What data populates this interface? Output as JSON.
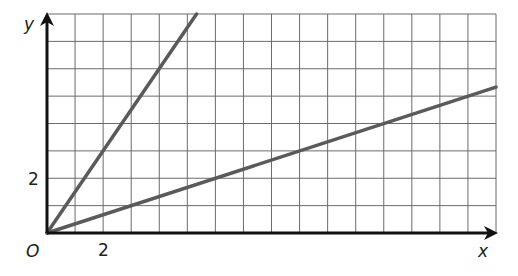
{
  "chart_data": {
    "type": "line",
    "title": "",
    "xlabel": "x",
    "ylabel": "y",
    "origin_label": "O",
    "xlim": [
      0,
      16
    ],
    "ylim": [
      0,
      8
    ],
    "grid": true,
    "grid_step": 1,
    "x_ticks": [
      {
        "value": 2,
        "label": "2"
      }
    ],
    "y_ticks": [
      {
        "value": 2,
        "label": "2"
      }
    ],
    "series": [
      {
        "name": "steep line",
        "equation": "y = 1.5x",
        "points": [
          [
            0,
            0
          ],
          [
            2,
            3
          ],
          [
            5.33,
            8
          ]
        ],
        "color": "#5a5a5a"
      },
      {
        "name": "shallow line",
        "equation": "y = x/3",
        "points": [
          [
            0,
            0
          ],
          [
            3,
            1
          ],
          [
            9,
            3
          ],
          [
            16,
            5.33
          ]
        ],
        "color": "#5a5a5a"
      }
    ]
  },
  "colors": {
    "grid": "#6b6b6b",
    "axis": "#111111",
    "line": "#5a5a5a"
  }
}
